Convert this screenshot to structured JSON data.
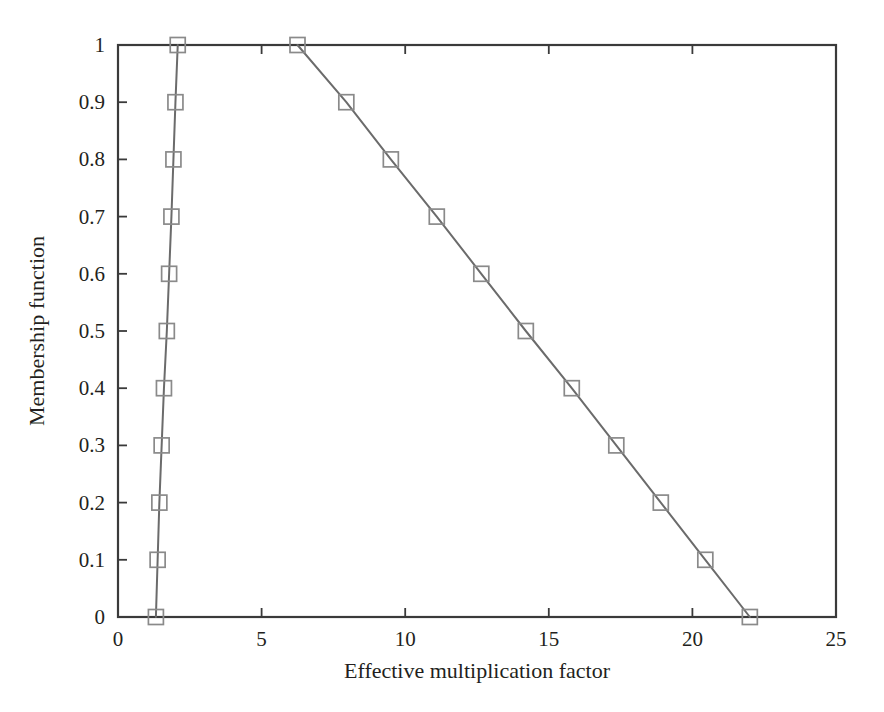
{
  "chart_data": {
    "type": "line",
    "title": "",
    "xlabel": "Effective multiplication factor",
    "ylabel": "Membership function",
    "xlim": [
      0,
      25
    ],
    "ylim": [
      0,
      1
    ],
    "xticks": [
      0,
      5,
      10,
      15,
      20,
      25
    ],
    "xtick_labels": [
      "0",
      "5",
      "10",
      "15",
      "20",
      "25"
    ],
    "yticks": [
      0,
      0.1,
      0.2,
      0.3,
      0.4,
      0.5,
      0.6,
      0.7,
      0.8,
      0.9,
      1
    ],
    "ytick_labels": [
      "0",
      "0.1",
      "0.2",
      "0.3",
      "0.4",
      "0.5",
      "0.6",
      "0.7",
      "0.8",
      "0.9",
      "1"
    ],
    "grid": false,
    "legend": null,
    "marker": "open-square",
    "line_color": "#6b6b6b",
    "marker_color": "#8a8a8a",
    "axis_color": "#3a3a3a",
    "background": "#ffffff",
    "series": [
      {
        "name": "lower-branch",
        "marker": "open-square",
        "x": [
          1.32,
          1.38,
          1.44,
          1.52,
          1.6,
          1.7,
          1.78,
          1.86,
          1.93,
          2.0,
          2.08
        ],
        "y": [
          0.0,
          0.1,
          0.2,
          0.3,
          0.4,
          0.5,
          0.6,
          0.7,
          0.8,
          0.9,
          1.0
        ]
      },
      {
        "name": "upper-branch",
        "marker": "open-square",
        "x": [
          22.0,
          20.45,
          18.9,
          17.35,
          15.8,
          14.2,
          12.65,
          11.1,
          9.5,
          7.95,
          6.25
        ],
        "y": [
          0.0,
          0.1,
          0.2,
          0.3,
          0.4,
          0.5,
          0.6,
          0.7,
          0.8,
          0.9,
          1.0
        ]
      }
    ]
  }
}
